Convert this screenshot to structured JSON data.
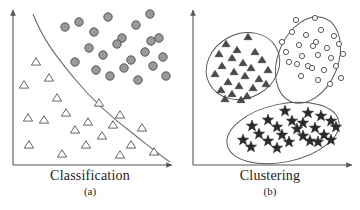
{
  "figure": {
    "background_color": "#ffffff",
    "width": 360,
    "height": 210
  },
  "panels": [
    {
      "id": "a",
      "caption": "Classification",
      "sublabel": "(a)",
      "axes": {
        "origin_x": 13,
        "origin_y": 165,
        "x_end": 172,
        "y_top": 10,
        "color": "#555555",
        "arrowheads": true,
        "tick_labels": [],
        "xlabel": "",
        "ylabel": ""
      },
      "boundary": {
        "name": "decision-boundary",
        "color": "#6b6b6b",
        "path": "M33,14 C44,42 58,58 74,78 C92,100 112,118 136,136 C150,147 161,156 170,162"
      }
    },
    {
      "id": "b",
      "caption": "Clustering",
      "sublabel": "(b)",
      "axes": {
        "origin_x": 193,
        "origin_y": 165,
        "x_end": 352,
        "y_top": 10,
        "color": "#555555",
        "arrowheads": true,
        "tick_labels": [],
        "xlabel": "",
        "ylabel": ""
      }
    }
  ],
  "chart_data": {
    "type": "scatter",
    "xlabel": "",
    "ylabel": "",
    "grid": false,
    "legend_position": "none",
    "panels": [
      {
        "id": "a",
        "label": "Classification",
        "sublabel": "(a)",
        "xlim": [
          0,
          180
        ],
        "ylim": [
          0,
          170
        ],
        "series": [
          {
            "name": "class-circle",
            "marker": "filled-circle",
            "fill": "#9a9a9a",
            "stroke": "#4a4a4a",
            "radius": 4.2,
            "count": 22,
            "points": [
              [
                65,
                27
              ],
              [
                79,
                22
              ],
              [
                94,
                32
              ],
              [
                108,
                17
              ],
              [
                122,
                38
              ],
              [
                136,
                25
              ],
              [
                150,
                14
              ],
              [
                151,
                41
              ],
              [
                89,
                48
              ],
              [
                103,
                55
              ],
              [
                117,
                44
              ],
              [
                131,
                60
              ],
              [
                145,
                52
              ],
              [
                159,
                38
              ],
              [
                75,
                62
              ],
              [
                96,
                70
              ],
              [
                110,
                76
              ],
              [
                124,
                68
              ],
              [
                138,
                80
              ],
              [
                153,
                66
              ],
              [
                163,
                57
              ],
              [
                166,
                76
              ]
            ]
          },
          {
            "name": "class-triangle",
            "marker": "open-triangle",
            "fill": "#ffffff",
            "stroke": "#4a4a4a",
            "size": 7.5,
            "count": 20,
            "points": [
              [
                36,
                62
              ],
              [
                24,
                85
              ],
              [
                49,
                78
              ],
              [
                57,
                98
              ],
              [
                28,
                118
              ],
              [
                44,
                120
              ],
              [
                66,
                113
              ],
              [
                29,
                145
              ],
              [
                75,
                130
              ],
              [
                88,
                122
              ],
              [
                99,
                103
              ],
              [
                86,
                145
              ],
              [
                102,
                136
              ],
              [
                113,
                125
              ],
              [
                120,
                115
              ],
              [
                131,
                145
              ],
              [
                142,
                128
              ],
              [
                154,
                152
              ],
              [
                120,
                155
              ],
              [
                62,
                154
              ]
            ]
          }
        ]
      },
      {
        "id": "b",
        "label": "Clustering",
        "sublabel": "(b)",
        "xlim": [
          180,
          360
        ],
        "ylim": [
          0,
          170
        ],
        "clusters": [
          {
            "name": "triangle-cluster",
            "marker": "filled-triangle",
            "fill": "#4a4a4a",
            "stroke": "#3a3a3a",
            "size": 6.5,
            "count": 24,
            "ellipse": {
              "cx": 243,
              "cy": 66,
              "rx": 38,
              "ry": 32,
              "rotation": -28,
              "stroke": "#555555"
            },
            "points": [
              [
                248,
                37
              ],
              [
                226,
                44
              ],
              [
                237,
                50
              ],
              [
                255,
                52
              ],
              [
                219,
                54
              ],
              [
                232,
                58
              ],
              [
                262,
                60
              ],
              [
                243,
                63
              ],
              [
                222,
                66
              ],
              [
                251,
                68
              ],
              [
                268,
                70
              ],
              [
                234,
                72
              ],
              [
                215,
                74
              ],
              [
                245,
                76
              ],
              [
                259,
                79
              ],
              [
                228,
                82
              ],
              [
                239,
                86
              ],
              [
                253,
                88
              ],
              [
                221,
                90
              ],
              [
                266,
                84
              ],
              [
                232,
                94
              ],
              [
                247,
                96
              ],
              [
                225,
                99
              ],
              [
                241,
                100
              ]
            ]
          },
          {
            "name": "circle-cluster",
            "marker": "open-circle",
            "fill": "#ffffff",
            "stroke": "#4a4a4a",
            "radius": 2.6,
            "count": 27,
            "ellipse": {
              "cx": 308,
              "cy": 60,
              "rx": 30,
              "ry": 45,
              "rotation": 22,
              "stroke": "#555555"
            },
            "points": [
              [
                296,
                20
              ],
              [
                315,
                18
              ],
              [
                292,
                32
              ],
              [
                306,
                35
              ],
              [
                321,
                30
              ],
              [
                334,
                36
              ],
              [
                282,
                42
              ],
              [
                299,
                45
              ],
              [
                313,
                46
              ],
              [
                316,
                42
              ],
              [
                327,
                48
              ],
              [
                339,
                44
              ],
              [
                286,
                52
              ],
              [
                302,
                56
              ],
              [
                318,
                55
              ],
              [
                331,
                58
              ],
              [
                343,
                54
              ],
              [
                289,
                62
              ],
              [
                297,
                64
              ],
              [
                308,
                66
              ],
              [
                312,
                68
              ],
              [
                324,
                70
              ],
              [
                336,
                66
              ],
              [
                301,
                76
              ],
              [
                318,
                80
              ],
              [
                330,
                84
              ],
              [
                341,
                78
              ]
            ]
          },
          {
            "name": "star-cluster",
            "marker": "filled-star",
            "fill": "#2a2a2a",
            "stroke": "#2a2a2a",
            "size": 6,
            "count": 24,
            "ellipse": {
              "cx": 283,
              "cy": 133,
              "rx": 57,
              "ry": 29,
              "rotation": -12,
              "stroke": "#555555"
            },
            "points": [
              [
                285,
                111
              ],
              [
                308,
                113
              ],
              [
                321,
                116
              ],
              [
                268,
                120
              ],
              [
                292,
                121
              ],
              [
                303,
                123
              ],
              [
                331,
                121
              ],
              [
                252,
                126
              ],
              [
                277,
                127
              ],
              [
                297,
                129
              ],
              [
                315,
                128
              ],
              [
                336,
                127
              ],
              [
                259,
                134
              ],
              [
                282,
                135
              ],
              [
                303,
                136
              ],
              [
                324,
                135
              ],
              [
                243,
                140
              ],
              [
                268,
                141
              ],
              [
                289,
                142
              ],
              [
                310,
                141
              ],
              [
                318,
                142
              ],
              [
                331,
                140
              ],
              [
                251,
                147
              ],
              [
                277,
                148
              ]
            ]
          }
        ]
      }
    ]
  }
}
